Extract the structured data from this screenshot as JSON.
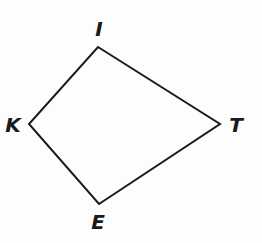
{
  "diagram": {
    "type": "kite",
    "stroke_color": "#1a1a1a",
    "vertices": [
      {
        "name": "I",
        "x": 98,
        "y": 47,
        "label_x": 99,
        "label_y": 29
      },
      {
        "name": "T",
        "x": 220,
        "y": 124,
        "label_x": 236,
        "label_y": 125
      },
      {
        "name": "E",
        "x": 99,
        "y": 204,
        "label_x": 98,
        "label_y": 222
      },
      {
        "name": "K",
        "x": 29,
        "y": 124,
        "label_x": 13,
        "label_y": 125
      }
    ],
    "labels": {
      "I": "I",
      "T": "T",
      "E": "E",
      "K": "K"
    }
  }
}
